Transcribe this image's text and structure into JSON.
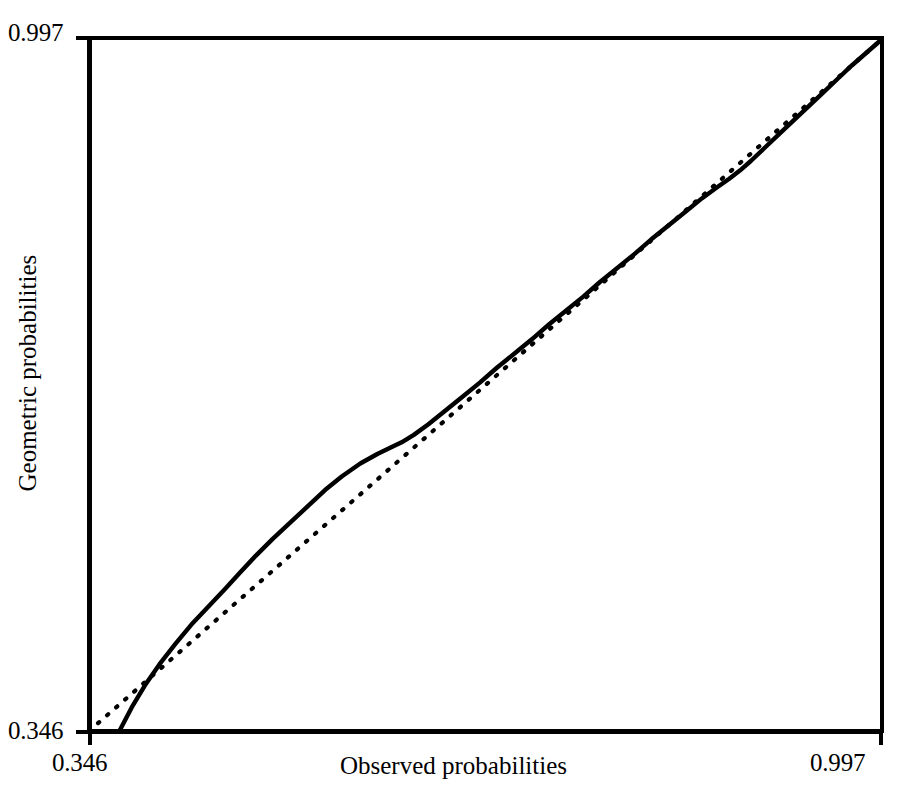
{
  "chart_data": {
    "type": "line",
    "title": "",
    "subtitle": "",
    "xlabel": "Observed probabilities",
    "ylabel": "Geometric probabilities",
    "xlim": [
      0.346,
      0.997
    ],
    "ylim": [
      0.346,
      0.997
    ],
    "xticks": [
      0.346,
      0.997
    ],
    "xticklabels": [
      "0.346",
      "0.997"
    ],
    "yticks": [
      0.346,
      0.997
    ],
    "yticklabels": [
      "0.346",
      "0.997"
    ],
    "grid": false,
    "legend": "none",
    "axis_style": "left-and-bottom-spines-only",
    "annotations": [],
    "series": [
      {
        "name": "reference-line",
        "style": "dotted",
        "color": "#000000",
        "description": "45-degree identity reference line y = x",
        "x": [
          0.346,
          0.997
        ],
        "y": [
          0.346,
          0.997
        ]
      },
      {
        "name": "geometric-pp-curve",
        "style": "solid",
        "color": "#000000",
        "description": "Empirical P-P curve of geometric probabilities versus observed probabilities",
        "x": [
          0.371,
          0.381,
          0.392,
          0.404,
          0.417,
          0.43,
          0.444,
          0.458,
          0.47,
          0.483,
          0.497,
          0.512,
          0.527,
          0.54,
          0.554,
          0.569,
          0.583,
          0.594,
          0.603,
          0.613,
          0.625,
          0.638,
          0.652,
          0.667,
          0.681,
          0.695,
          0.71,
          0.724,
          0.738,
          0.752,
          0.766,
          0.78,
          0.794,
          0.808,
          0.822,
          0.836,
          0.85,
          0.862,
          0.872,
          0.881,
          0.89,
          0.901,
          0.913,
          0.925,
          0.937,
          0.949,
          0.961,
          0.973,
          0.985,
          0.997
        ],
        "y": [
          0.346,
          0.368,
          0.389,
          0.409,
          0.428,
          0.446,
          0.463,
          0.48,
          0.495,
          0.511,
          0.527,
          0.543,
          0.559,
          0.573,
          0.586,
          0.598,
          0.607,
          0.613,
          0.618,
          0.625,
          0.635,
          0.647,
          0.66,
          0.674,
          0.688,
          0.701,
          0.715,
          0.729,
          0.742,
          0.755,
          0.769,
          0.782,
          0.795,
          0.809,
          0.822,
          0.835,
          0.848,
          0.858,
          0.866,
          0.874,
          0.883,
          0.895,
          0.908,
          0.921,
          0.934,
          0.947,
          0.96,
          0.973,
          0.985,
          0.997
        ]
      }
    ]
  },
  "axes": {
    "y_max_label": "0.997",
    "y_min_label": "0.346",
    "x_min_label": "0.346",
    "x_max_label": "0.997",
    "x_title": "Observed probabilities",
    "y_title": "Geometric probabilities"
  },
  "colors": {
    "ink": "#000000",
    "background": "#ffffff"
  }
}
